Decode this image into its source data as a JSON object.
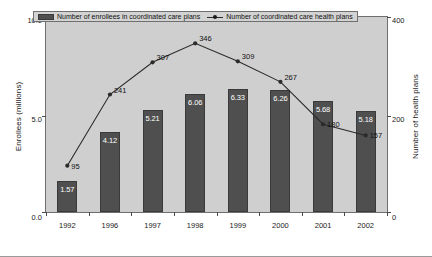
{
  "chart_data": {
    "type": "bar",
    "title": "",
    "subtitle": "",
    "categories": [
      "1992",
      "1996",
      "1997",
      "1998",
      "1999",
      "2000",
      "2001",
      "2002"
    ],
    "xlabel": "",
    "ylabel": "Enrollees (millions)",
    "ylabel_secondary": "Number of health plans",
    "ylim": [
      0.0,
      10.0
    ],
    "ylim_secondary": [
      0,
      400
    ],
    "yticks": [
      "0.0",
      "5.0",
      "10.0"
    ],
    "yticks_secondary": [
      "0",
      "200",
      "400"
    ],
    "grid": false,
    "legend_position": "top-left-inside",
    "series": [
      {
        "name": "Number of enrollees in coordinated care plans",
        "type": "bar",
        "axis": "left",
        "color": "#4f4f4f",
        "values": [
          1.57,
          4.12,
          5.21,
          6.06,
          6.33,
          6.26,
          5.68,
          5.18
        ],
        "labels": [
          "1.57",
          "4.12",
          "5.21",
          "6.06",
          "6.33",
          "6.26",
          "5.68",
          "5.18"
        ]
      },
      {
        "name": "Number of coordinated care health plans",
        "type": "line",
        "axis": "right",
        "color": "#2b2b2b",
        "values": [
          95,
          241,
          307,
          346,
          309,
          267,
          180,
          157
        ],
        "labels": [
          "95",
          "241",
          "307",
          "346",
          "309",
          "267",
          "180",
          "157"
        ]
      }
    ]
  },
  "legend": {
    "entries": [
      {
        "label": "Number of enrollees in coordinated care plans",
        "marker": "bar-swatch-icon"
      },
      {
        "label": "Number of coordinated care health plans",
        "marker": "line-marker-icon"
      }
    ]
  },
  "axes": {
    "left_title": "Enrollees (millions)",
    "right_title": "Number of health plans"
  }
}
